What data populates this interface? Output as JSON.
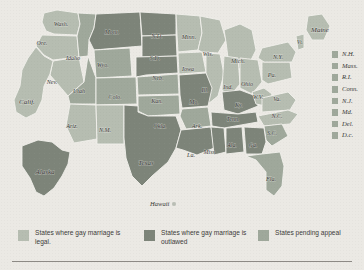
{
  "colors": {
    "legal": "#b6bdb1",
    "outlawed": "#7d8479",
    "pending": "#9fa89b",
    "background": "#ebe9e4",
    "border": "#f2f0ec",
    "text": "#3a3a38"
  },
  "map": {
    "title": "",
    "hawaii_label": "Hawaii",
    "states": [
      {
        "abbr": "Wash.",
        "status": "legal",
        "lx": 61,
        "ly": 25
      },
      {
        "abbr": "Ore.",
        "status": "legal",
        "lx": 42,
        "ly": 44
      },
      {
        "abbr": "Idaho",
        "status": "pending",
        "lx": 73,
        "ly": 59
      },
      {
        "abbr": "Mont.",
        "status": "outlawed",
        "lx": 112,
        "ly": 33
      },
      {
        "abbr": "N.D.",
        "status": "outlawed",
        "lx": 157,
        "ly": 37
      },
      {
        "abbr": "S.D.",
        "status": "outlawed",
        "lx": 155,
        "ly": 59
      },
      {
        "abbr": "Minn.",
        "status": "legal",
        "lx": 189,
        "ly": 38
      },
      {
        "abbr": "Wyo.",
        "status": "pending",
        "lx": 103,
        "ly": 66
      },
      {
        "abbr": "Nev.",
        "status": "legal",
        "lx": 52,
        "ly": 83
      },
      {
        "abbr": "Utah",
        "status": "pending",
        "lx": 79,
        "ly": 92
      },
      {
        "abbr": "Calif.",
        "status": "legal",
        "lx": 27,
        "ly": 102
      },
      {
        "abbr": "Colo.",
        "status": "pending",
        "lx": 115,
        "ly": 98
      },
      {
        "abbr": "Neb.",
        "status": "outlawed",
        "lx": 158,
        "ly": 79
      },
      {
        "abbr": "Iowa",
        "status": "legal",
        "lx": 188,
        "ly": 70
      },
      {
        "abbr": "Wis.",
        "status": "legal",
        "lx": 208,
        "ly": 55
      },
      {
        "abbr": "Mich.",
        "status": "legal",
        "lx": 238,
        "ly": 62
      },
      {
        "abbr": "Ill.",
        "status": "legal",
        "lx": 205,
        "ly": 91
      },
      {
        "abbr": "Ind.",
        "status": "legal",
        "lx": 228,
        "ly": 88
      },
      {
        "abbr": "Ohio",
        "status": "legal",
        "lx": 247,
        "ly": 85
      },
      {
        "abbr": "Pa.",
        "status": "legal",
        "lx": 272,
        "ly": 76
      },
      {
        "abbr": "N.Y.",
        "status": "legal",
        "lx": 278,
        "ly": 58
      },
      {
        "abbr": "Vt.",
        "status": "legal",
        "lx": 300,
        "ly": 43
      },
      {
        "abbr": "Maine",
        "status": "legal",
        "lx": 320,
        "ly": 30
      },
      {
        "abbr": "Kan.",
        "status": "pending",
        "lx": 157,
        "ly": 102
      },
      {
        "abbr": "Mo.",
        "status": "outlawed",
        "lx": 194,
        "ly": 103
      },
      {
        "abbr": "Ky.",
        "status": "outlawed",
        "lx": 239,
        "ly": 106
      },
      {
        "abbr": "W.V.",
        "status": "legal",
        "lx": 258,
        "ly": 98
      },
      {
        "abbr": "Va.",
        "status": "legal",
        "lx": 277,
        "ly": 100
      },
      {
        "abbr": "Tenn.",
        "status": "outlawed",
        "lx": 233,
        "ly": 120
      },
      {
        "abbr": "N.C.",
        "status": "legal",
        "lx": 277,
        "ly": 117
      },
      {
        "abbr": "Okla.",
        "status": "pending",
        "lx": 160,
        "ly": 127
      },
      {
        "abbr": "Ark.",
        "status": "pending",
        "lx": 197,
        "ly": 127
      },
      {
        "abbr": "S.C.",
        "status": "pending",
        "lx": 272,
        "ly": 134
      },
      {
        "abbr": "Ariz.",
        "status": "legal",
        "lx": 72,
        "ly": 127
      },
      {
        "abbr": "N.M.",
        "status": "legal",
        "lx": 105,
        "ly": 131
      },
      {
        "abbr": "Texas",
        "status": "outlawed",
        "lx": 146,
        "ly": 163
      },
      {
        "abbr": "La.",
        "status": "outlawed",
        "lx": 191,
        "ly": 156
      },
      {
        "abbr": "Miss.",
        "status": "outlawed",
        "lx": 210,
        "ly": 153
      },
      {
        "abbr": "Ala.",
        "status": "outlawed",
        "lx": 232,
        "ly": 146
      },
      {
        "abbr": "Ga.",
        "status": "outlawed",
        "lx": 253,
        "ly": 146
      },
      {
        "abbr": "Fla.",
        "status": "pending",
        "lx": 271,
        "ly": 180
      },
      {
        "abbr": "Alaska",
        "status": "outlawed",
        "lx": 45,
        "ly": 172
      }
    ]
  },
  "small_states": {
    "swatch_status": "pending",
    "items": [
      {
        "label": "N.H."
      },
      {
        "label": "Mass."
      },
      {
        "label": "R.I."
      },
      {
        "label": "Conn."
      },
      {
        "label": "N.J."
      },
      {
        "label": "Md."
      },
      {
        "label": "Del."
      },
      {
        "label": "D.c."
      }
    ]
  },
  "legend": {
    "items": [
      {
        "label": "States where gay marriage is legal.",
        "status": "legal"
      },
      {
        "label": "States where gay marriage is outlawed",
        "status": "outlawed"
      },
      {
        "label": "States pending appeal",
        "status": "pending"
      }
    ]
  }
}
